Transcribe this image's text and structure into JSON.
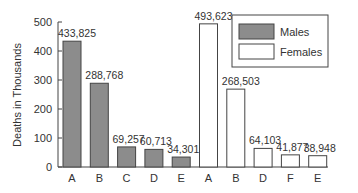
{
  "chart_data": {
    "type": "bar",
    "title": "",
    "xlabel": "",
    "ylabel": "Deaths in Thousands",
    "ylim": [
      0,
      500
    ],
    "yticks": [
      0,
      100,
      200,
      300,
      400,
      500
    ],
    "grid": false,
    "legend_position": "top-right",
    "series": [
      {
        "name": "Males",
        "color": "#8c8c8c",
        "categories": [
          "A",
          "B",
          "C",
          "D",
          "E"
        ],
        "values": [
          433.825,
          288.768,
          69.257,
          60.713,
          34.301
        ],
        "labels": [
          "433,825",
          "288,768",
          "69,257",
          "60,713",
          "34,301"
        ]
      },
      {
        "name": "Females",
        "color": "#ffffff",
        "categories": [
          "A",
          "B",
          "D",
          "F",
          "E"
        ],
        "values": [
          493.623,
          268.503,
          64.103,
          41.877,
          38.948
        ],
        "labels": [
          "493,623",
          "268,503",
          "64,103",
          "41,877",
          "38,948"
        ]
      }
    ]
  }
}
